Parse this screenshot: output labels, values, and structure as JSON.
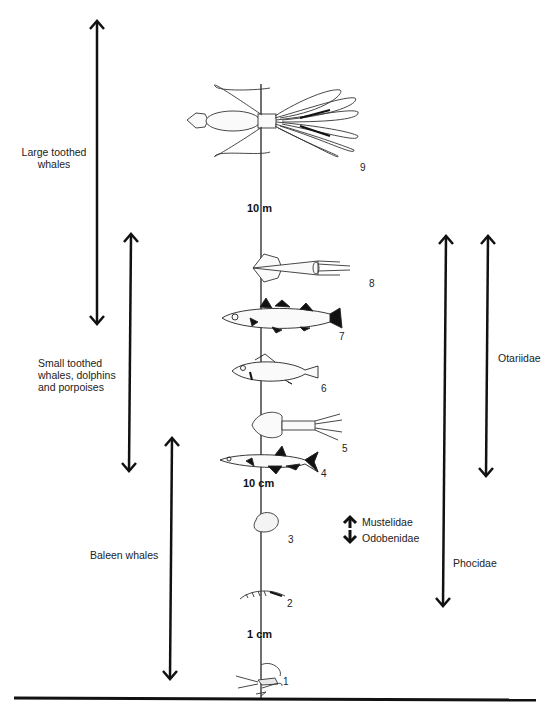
{
  "diagram": {
    "type": "size-scale prey diagram",
    "axis": {
      "scale_marks": [
        {
          "label": "10 m",
          "y": 209
        },
        {
          "label": "10 cm",
          "y": 483
        },
        {
          "label": "1 cm",
          "y": 636
        }
      ]
    },
    "prey": [
      {
        "number": "1",
        "name": "copepod-icon"
      },
      {
        "number": "2",
        "name": "krill-icon"
      },
      {
        "number": "3",
        "name": "clam-icon"
      },
      {
        "number": "4",
        "name": "small-fish-icon"
      },
      {
        "number": "5",
        "name": "small-squid-icon"
      },
      {
        "number": "6",
        "name": "perch-fish-icon"
      },
      {
        "number": "7",
        "name": "cod-fish-icon"
      },
      {
        "number": "8",
        "name": "squid-icon"
      },
      {
        "number": "9",
        "name": "giant-squid-icon"
      }
    ],
    "ranges": {
      "large_toothed": {
        "label_line1": "Large toothed",
        "label_line2": "whales"
      },
      "small_toothed": {
        "label_line1": "Small toothed",
        "label_line2": "whales, dolphins",
        "label_line3": "and porpoises"
      },
      "baleen": {
        "label": "Baleen whales"
      },
      "mustelidae": {
        "label": "Mustelidae"
      },
      "odobenidae": {
        "label": "Odobenidae"
      },
      "phocidae": {
        "label": "Phocidae"
      },
      "otariidae": {
        "label": "Otariidae"
      }
    }
  }
}
